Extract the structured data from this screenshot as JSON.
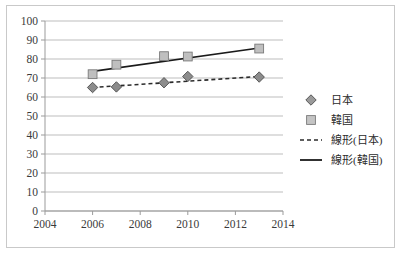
{
  "chart_data": {
    "type": "scatter",
    "title": "",
    "xlabel": "",
    "ylabel": "",
    "xlim": [
      2004,
      2014
    ],
    "ylim": [
      0,
      100
    ],
    "xticks": [
      2004,
      2006,
      2008,
      2010,
      2012,
      2014
    ],
    "yticks": [
      0,
      10,
      20,
      30,
      40,
      50,
      60,
      70,
      80,
      90,
      100
    ],
    "grid": "horizontal",
    "legend_position": "right",
    "series": [
      {
        "name": "日本",
        "marker": "diamond",
        "color": "#8c8c8c",
        "x": [
          2006,
          2007,
          2009,
          2010,
          2013
        ],
        "values": [
          65.0,
          65.3,
          67.5,
          70.8,
          70.5
        ]
      },
      {
        "name": "韓国",
        "marker": "square",
        "color": "#bfbfbf",
        "x": [
          2006,
          2007,
          2009,
          2010,
          2013
        ],
        "values": [
          72.0,
          77.0,
          81.5,
          81.3,
          85.5
        ]
      }
    ],
    "trendlines": [
      {
        "name": "線形(日本)",
        "style": "dashed",
        "color": "#2b2b2b",
        "x": [
          2006,
          2013
        ],
        "values": [
          65.0,
          70.8
        ]
      },
      {
        "name": "線形(韓国)",
        "style": "solid",
        "color": "#1a1a1a",
        "x": [
          2006,
          2013
        ],
        "values": [
          73.5,
          85.8
        ]
      }
    ],
    "legend": [
      {
        "label": "日本",
        "symbol": "diamond",
        "color": "#9a9a9a"
      },
      {
        "label": "韓国",
        "symbol": "square",
        "color": "#c4c4c4"
      },
      {
        "label": "線形(日本)",
        "symbol": "dashed-line",
        "color": "#2b2b2b"
      },
      {
        "label": "線形(韓国)",
        "symbol": "solid-line",
        "color": "#1a1a1a"
      }
    ]
  },
  "axis": {
    "y_labels": [
      "100",
      "90",
      "80",
      "70",
      "60",
      "50",
      "40",
      "30",
      "20",
      "10",
      "0"
    ],
    "x_labels": [
      "2004",
      "2006",
      "2008",
      "2010",
      "2012",
      "2014"
    ]
  },
  "legend": {
    "items": [
      {
        "label": "日本"
      },
      {
        "label": "韓国"
      },
      {
        "label": "線形(日本)"
      },
      {
        "label": "線形(韓国)"
      }
    ]
  }
}
